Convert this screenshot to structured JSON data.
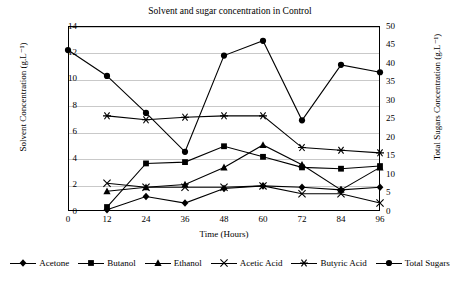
{
  "chart_data": {
    "type": "line",
    "title": "Solvent and sugar concentration in Control",
    "xlabel": "Time (Hours)",
    "ylabel": "Solvent Concentration (g.L⁻¹)",
    "y2label": "Total Sugars Concentration (g.L⁻¹)",
    "x": [
      0,
      12,
      24,
      36,
      48,
      60,
      72,
      84,
      96
    ],
    "xticklabels": [
      "0",
      "12",
      "24",
      "36",
      "48",
      "60",
      "72",
      "84",
      "96"
    ],
    "ylim": [
      0,
      14
    ],
    "yticklabels": [
      "0",
      "2",
      "4",
      "6",
      "8",
      "10",
      "12",
      "14"
    ],
    "y2lim": [
      0,
      50
    ],
    "y2ticklabels": [
      "0",
      "5",
      "10",
      "15",
      "20",
      "25",
      "30",
      "35",
      "40",
      "45",
      "50"
    ],
    "grid": true,
    "legend_position": "bottom",
    "series": [
      {
        "name": "Acetone",
        "marker": "diamond",
        "axis": "left",
        "values": [
          null,
          0.1,
          1.1,
          0.6,
          1.7,
          1.9,
          1.8,
          1.6,
          1.8
        ]
      },
      {
        "name": "Butanol",
        "marker": "square",
        "axis": "left",
        "values": [
          null,
          0.3,
          3.6,
          3.7,
          4.9,
          4.1,
          3.3,
          3.2,
          3.4
        ]
      },
      {
        "name": "Ethanol",
        "marker": "triangle",
        "axis": "left",
        "values": [
          null,
          1.5,
          1.8,
          2.0,
          3.3,
          5.0,
          3.5,
          1.6,
          3.3
        ]
      },
      {
        "name": "Acetic Acid",
        "marker": "cross",
        "axis": "left",
        "values": [
          null,
          2.1,
          1.8,
          1.8,
          1.8,
          1.9,
          1.3,
          1.3,
          0.6
        ]
      },
      {
        "name": "Butyric Acid",
        "marker": "asterisk",
        "axis": "left",
        "values": [
          null,
          7.2,
          6.9,
          7.1,
          7.2,
          7.2,
          4.8,
          4.6,
          4.4
        ]
      },
      {
        "name": "Total Sugars",
        "marker": "circle",
        "axis": "right",
        "values": [
          43.5,
          36.5,
          26.5,
          16.0,
          42.0,
          46.0,
          24.5,
          39.5,
          37.5
        ]
      }
    ]
  }
}
